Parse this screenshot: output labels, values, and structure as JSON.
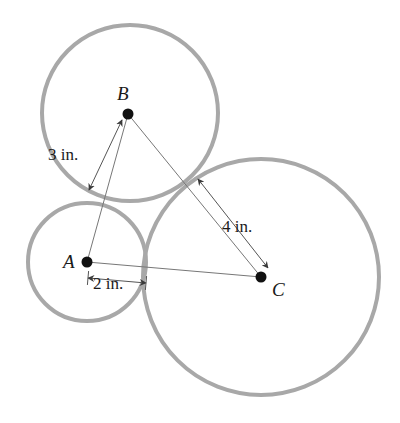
{
  "figure": {
    "background_color": "#ffffff",
    "circle_stroke_color": "#a8a8a8",
    "circle_stroke_width": 4,
    "segment_stroke_color": "#777777",
    "segment_stroke_width": 1,
    "dimension_stroke_color": "#555555",
    "dimension_stroke_width": 1,
    "vertex_dot_color": "#111111",
    "vertex_dot_radius": 5.5,
    "label_color": "#1a1a1a"
  },
  "circles": [
    {
      "name": "circle-a",
      "center_label": "A",
      "cx": 87,
      "cy": 262,
      "r": 59,
      "radius_in": 2
    },
    {
      "name": "circle-b",
      "center_label": "B",
      "cx": 130,
      "cy": 113,
      "r": 88,
      "radius_in": 3
    },
    {
      "name": "circle-c",
      "center_label": "C",
      "cx": 261,
      "cy": 277,
      "r": 118,
      "radius_in": 4
    }
  ],
  "vertices": [
    {
      "name": "vertex-a",
      "label": "A",
      "x": 87,
      "y": 262,
      "label_x": 63,
      "label_y": 268
    },
    {
      "name": "vertex-b",
      "label": "B",
      "x": 128,
      "y": 114,
      "label_x": 117,
      "label_y": 100
    },
    {
      "name": "vertex-c",
      "label": "C",
      "x": 261,
      "y": 277,
      "label_x": 272,
      "label_y": 296
    }
  ],
  "triangle": {
    "name": "triangle-abc",
    "sides": [
      {
        "name": "side-ab",
        "x1": 87,
        "y1": 262,
        "x2": 128,
        "y2": 114
      },
      {
        "name": "side-bc",
        "x1": 128,
        "y1": 114,
        "x2": 261,
        "y2": 277
      },
      {
        "name": "side-ac",
        "x1": 87,
        "y1": 262,
        "x2": 261,
        "y2": 277
      }
    ]
  },
  "dimensions": [
    {
      "name": "dimension-3-in",
      "label": "3 in.",
      "value": 3,
      "unit": "in.",
      "label_x": 48,
      "label_y": 160,
      "x1": 122,
      "y1": 120,
      "x2": 89,
      "y2": 190
    },
    {
      "name": "dimension-4-in",
      "label": "4 in.",
      "value": 4,
      "unit": "in.",
      "label_x": 222,
      "label_y": 232,
      "x1": 198,
      "y1": 179,
      "x2": 268,
      "y2": 268
    },
    {
      "name": "dimension-2-in",
      "label": "2 in.",
      "value": 2,
      "unit": "in.",
      "label_x": 93,
      "label_y": 289,
      "x1": 88,
      "y1": 278,
      "x2": 146,
      "y2": 283
    }
  ]
}
